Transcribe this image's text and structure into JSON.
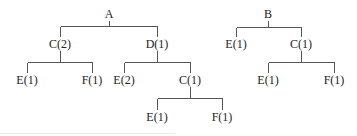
{
  "diagram": {
    "type": "tree",
    "trees": [
      {
        "root": "A",
        "children": [
          {
            "label": "C(2)",
            "children": [
              {
                "label": "E(1)"
              },
              {
                "label": "F(1)"
              }
            ]
          },
          {
            "label": "D(1)",
            "children": [
              {
                "label": "E(2)"
              },
              {
                "label": "C(1)",
                "children": [
                  {
                    "label": "E(1)"
                  },
                  {
                    "label": "F(1)"
                  }
                ]
              }
            ]
          }
        ]
      },
      {
        "root": "B",
        "children": [
          {
            "label": "E(1)"
          },
          {
            "label": "C(1)",
            "children": [
              {
                "label": "E(1)"
              },
              {
                "label": "F(1)"
              }
            ]
          }
        ]
      }
    ]
  },
  "nodes": {
    "a_root": "A",
    "a_c": "C(2)",
    "a_c_e": "E(1)",
    "a_c_f": "F(1)",
    "a_d": "D(1)",
    "a_d_e": "E(2)",
    "a_d_c": "C(1)",
    "a_d_c_e": "E(1)",
    "a_d_c_f": "F(1)",
    "b_root": "B",
    "b_e": "E(1)",
    "b_c": "C(1)",
    "b_c_e": "E(1)",
    "b_c_f": "F(1)"
  },
  "colors": {
    "line": "#555555",
    "text": "#222222",
    "background": "#ffffff"
  }
}
